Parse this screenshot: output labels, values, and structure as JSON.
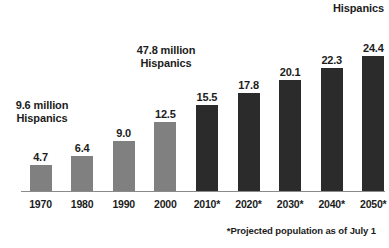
{
  "chart_data": {
    "type": "bar",
    "title": "",
    "xlabel": "",
    "ylabel": "",
    "ylim": [
      0,
      26
    ],
    "grid": false,
    "legend": "none",
    "categories": [
      "1970",
      "1980",
      "1990",
      "2000",
      "2010*",
      "2020*",
      "2030*",
      "2040*",
      "2050*"
    ],
    "values": [
      4.7,
      6.4,
      9.0,
      12.5,
      15.5,
      17.8,
      20.1,
      22.3,
      24.4
    ],
    "value_labels": [
      "4.7",
      "6.4",
      "9.0",
      "12.5",
      "15.5",
      "17.8",
      "20.1",
      "22.3",
      "24.4"
    ],
    "series": [
      {
        "name": "Percent Hispanic of total U.S. population",
        "values": [
          4.7,
          6.4,
          9.0,
          12.5,
          15.5,
          17.8,
          20.1,
          22.3,
          24.4
        ]
      }
    ],
    "bar_kinds": [
      "actual",
      "actual",
      "actual",
      "actual",
      "projected",
      "projected",
      "projected",
      "projected",
      "projected"
    ],
    "colors": {
      "actual_bar": "#808080",
      "projected_bar": "#2b2b2b",
      "axis_line": "#8a8a8a",
      "text": "#1c1c1c",
      "background": "#ffffff"
    },
    "annotations": [
      {
        "id": "left",
        "lines": [
          "9.6 million",
          "Hispanics"
        ],
        "anchor_category": "1970"
      },
      {
        "id": "mid",
        "lines": [
          "47.8 million",
          "Hispanics"
        ],
        "anchor_category": "2000"
      },
      {
        "id": "right",
        "lines": [
          "Hispanics"
        ],
        "anchor_category": "2050*"
      }
    ],
    "footnote": "*Projected population as of July 1"
  },
  "callouts": {
    "left_line1": "9.6 million",
    "left_line2": "Hispanics",
    "mid_line1": "47.8 million",
    "mid_line2": "Hispanics",
    "right_line1": "Hispanics"
  },
  "footnote": {
    "text": "*Projected population as of July 1"
  }
}
